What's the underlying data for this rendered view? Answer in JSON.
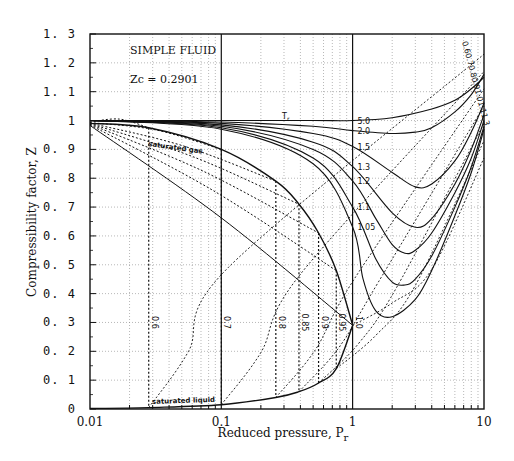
{
  "chart_data": {
    "type": "line",
    "title": "SIMPLE FLUID",
    "annotations": [
      "SIMPLE FLUID",
      "Zc = 0.2901",
      "Tr",
      "saturated gas",
      "saturated liquid"
    ],
    "xlabel": "Reduced pressure, Pr",
    "xlabel_main": "Reduced pressure, P",
    "xlabel_sub": "r",
    "ylabel": "Compressibility factor, Z",
    "xscale": "log",
    "xlim": [
      0.01,
      10
    ],
    "ylim": [
      0,
      1.3
    ],
    "xticks": [
      "0.01",
      "0.1",
      "1",
      "10"
    ],
    "yticks": [
      "0",
      "0. 1",
      "0. 2",
      "0. 3",
      "0. 4",
      "0. 5",
      "0. 6",
      "0. 7",
      "0. 8",
      "0. 9",
      "1",
      "1. 1",
      "1. 2",
      "1. 3"
    ],
    "grid": true,
    "legend": "none",
    "supercritical_isotherms": [
      {
        "name": "Tr = 5.0",
        "label": "5.0",
        "x": [
          0.01,
          0.1,
          0.5,
          1,
          2,
          4,
          6,
          8,
          10
        ],
        "y": [
          1.0,
          1.0,
          1.0,
          1.0,
          1.01,
          1.04,
          1.07,
          1.11,
          1.15
        ]
      },
      {
        "name": "Tr = 2.0",
        "label": "2.0",
        "x": [
          0.01,
          0.1,
          0.5,
          1,
          2,
          3,
          4,
          6,
          8,
          10
        ],
        "y": [
          1.0,
          0.995,
          0.98,
          0.965,
          0.955,
          0.96,
          0.975,
          1.03,
          1.09,
          1.16
        ]
      },
      {
        "name": "Tr = 1.5",
        "label": "1.5",
        "x": [
          0.01,
          0.1,
          0.5,
          1,
          2,
          3,
          4,
          6,
          8,
          10
        ],
        "y": [
          1.0,
          0.99,
          0.955,
          0.91,
          0.82,
          0.77,
          0.78,
          0.86,
          0.96,
          1.06
        ]
      },
      {
        "name": "Tr = 1.3",
        "label": "1.3",
        "x": [
          0.01,
          0.1,
          0.5,
          1,
          2,
          3,
          4,
          6,
          8,
          10
        ],
        "y": [
          1.0,
          0.985,
          0.925,
          0.84,
          0.68,
          0.63,
          0.66,
          0.78,
          0.9,
          1.02
        ]
      },
      {
        "name": "Tr = 1.2",
        "label": "1.2",
        "x": [
          0.01,
          0.1,
          0.5,
          1,
          1.5,
          2,
          2.5,
          3,
          4,
          6,
          8,
          10
        ],
        "y": [
          1.0,
          0.98,
          0.9,
          0.79,
          0.66,
          0.57,
          0.54,
          0.55,
          0.61,
          0.75,
          0.87,
          1.0
        ]
      },
      {
        "name": "Tr = 1.1",
        "label": "1.1",
        "x": [
          0.01,
          0.1,
          0.5,
          1,
          1.5,
          2,
          2.5,
          3,
          4,
          6,
          8,
          10
        ],
        "y": [
          1.0,
          0.975,
          0.87,
          0.7,
          0.52,
          0.44,
          0.43,
          0.45,
          0.53,
          0.7,
          0.84,
          0.98
        ]
      },
      {
        "name": "Tr = 1.05",
        "label": "1.05",
        "x": [
          0.01,
          0.1,
          0.5,
          1,
          1.2,
          1.5,
          2,
          3,
          4,
          6,
          8,
          10
        ],
        "y": [
          1.0,
          0.97,
          0.85,
          0.63,
          0.45,
          0.34,
          0.32,
          0.38,
          0.48,
          0.67,
          0.82,
          0.97
        ]
      }
    ],
    "subcritical_isotherms_dotted_labels": [
      "0.6",
      "0.7",
      "0.8",
      "0.85",
      "0.9",
      "0.95",
      "1.0"
    ],
    "saturation_pressures": {
      "0.6": 0.028,
      "0.7": 0.1,
      "0.8": 0.26,
      "0.85": 0.39,
      "0.9": 0.55,
      "0.95": 0.75,
      "1.0": 1.0
    },
    "saturated_gas": {
      "x": [
        0.01,
        0.028,
        0.1,
        0.26,
        0.39,
        0.55,
        0.75,
        1.0
      ],
      "y": [
        0.99,
        0.975,
        0.9,
        0.79,
        0.71,
        0.61,
        0.48,
        0.29
      ]
    },
    "saturated_liquid": {
      "x": [
        0.01,
        0.028,
        0.1,
        0.26,
        0.39,
        0.55,
        0.75,
        1.0
      ],
      "y": [
        0.002,
        0.005,
        0.015,
        0.04,
        0.06,
        0.09,
        0.14,
        0.29
      ]
    },
    "high_pressure_labels": [
      "0.6",
      "0.7",
      "0.8",
      "0.9",
      "1.0",
      "1.1",
      "1.3"
    ]
  }
}
